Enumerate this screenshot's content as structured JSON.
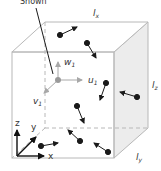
{
  "diagram": {
    "callout": {
      "label": "Shown"
    },
    "dimensions": {
      "lx": "l",
      "lx_sub": "x",
      "ly": "l",
      "ly_sub": "y",
      "lz": "l",
      "lz_sub": "z"
    },
    "velocity_components": {
      "u": "u",
      "u_sub": "1",
      "v": "v",
      "v_sub": "1",
      "w": "w",
      "w_sub": "1"
    },
    "axes": {
      "x": "x",
      "y": "y",
      "z": "z"
    },
    "colors": {
      "edge": "#b8b8b8",
      "shaded_face": "#ececec",
      "molecule": "#1a1a1a",
      "highlight_molecule": "#9a9a9a",
      "component_arrow": "#a8a8a8",
      "text": "#333333"
    }
  }
}
